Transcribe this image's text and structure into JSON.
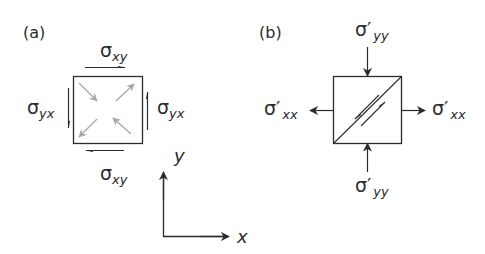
{
  "panels": {
    "a": {
      "label": "(a)",
      "top": {
        "sym": "σ",
        "sub": "xy"
      },
      "bottom": {
        "sym": "σ",
        "sub": "xy"
      },
      "left": {
        "sym": "σ",
        "sub": "yx"
      },
      "right": {
        "sym": "σ",
        "sub": "yx"
      }
    },
    "b": {
      "label": "(b)",
      "top": {
        "sym": "σ′",
        "sub": "yy"
      },
      "bottom": {
        "sym": "σ′",
        "sub": "yy"
      },
      "left": {
        "sym": "σ′",
        "sub": "xx"
      },
      "right": {
        "sym": "σ′",
        "sub": "xx"
      }
    }
  },
  "axes": {
    "x_label": "x",
    "y_label": "y"
  },
  "colors": {
    "line": "#2b2b2b",
    "inner_arrow": "#a8a8a8"
  }
}
